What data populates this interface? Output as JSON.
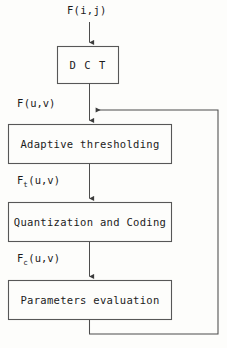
{
  "diagram": {
    "stroke_color": "#4a4a4a",
    "text_color": "#1b1b1b",
    "background_color": "#fdfdfb",
    "input_label": "F(i,j)",
    "nodes": [
      {
        "id": "dct",
        "label": "D C T",
        "x": 57,
        "y": 46,
        "w": 62,
        "h": 38
      },
      {
        "id": "adaptive-thresholding",
        "label": "Adaptive thresholding",
        "x": 8,
        "y": 124,
        "w": 164,
        "h": 40
      },
      {
        "id": "quantization-and-coding",
        "label": "Quantization and Coding",
        "x": 8,
        "y": 202,
        "w": 164,
        "h": 40
      },
      {
        "id": "parameters-evaluation",
        "label": "Parameters evaluation",
        "x": 8,
        "y": 280,
        "w": 164,
        "h": 40
      }
    ],
    "edge_labels": [
      {
        "id": "f-uv",
        "base": "F",
        "sub": "",
        "rest": "(u,v)",
        "x": 17,
        "y": 97
      },
      {
        "id": "f-t-uv",
        "base": "F",
        "sub": "t",
        "rest": "(u,v)",
        "x": 17,
        "y": 174
      },
      {
        "id": "f-c-uv",
        "base": "F",
        "sub": "c",
        "rest": "(u,v)",
        "x": 17,
        "y": 252
      }
    ],
    "feedback": {
      "id": "feedback-loop",
      "description": "Parameters evaluation output fed back to the adaptive thresholding input",
      "right_rail_x": 218,
      "top_y": 110,
      "bottom_y": 334
    }
  }
}
